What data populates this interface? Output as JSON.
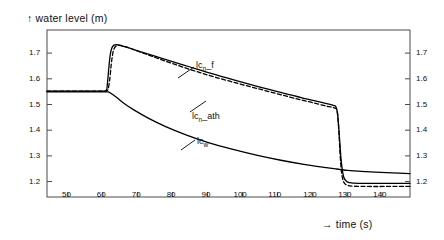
{
  "chart_data": {
    "type": "line",
    "title": "↑  water level (m)",
    "xlabel": "→  time (s)",
    "ylabel": "water level (m)",
    "xlim": [
      44,
      148
    ],
    "ylim": [
      1.14,
      1.79
    ],
    "xticks": [
      50,
      60,
      70,
      80,
      90,
      100,
      110,
      120,
      130,
      140
    ],
    "xticklabels": [
      "50",
      "60",
      "70",
      "80",
      "90",
      "100",
      "110",
      "120",
      "130",
      "140"
    ],
    "yticks": [
      1.2,
      1.3,
      1.4,
      1.5,
      1.6,
      1.7
    ],
    "yticklabels_left": [
      "1.2",
      "1.3",
      "1.4",
      "1.5",
      "1.6",
      "1.7"
    ],
    "yticklabels_right": [
      "1.2",
      "1.3",
      "1.4",
      "1.5",
      "1.6",
      "1.7"
    ],
    "grid": false,
    "legend": "inline-annotations",
    "series": [
      {
        "name": "lcn_f",
        "label_text": "lc",
        "label_sub": "n",
        "label_tail": "_f",
        "style": "dashed",
        "color": "#000000",
        "x": [
          44,
          50,
          55,
          58,
          60,
          61,
          61.5,
          62,
          62.4,
          62.8,
          63.2,
          63.8,
          64.5,
          66,
          68,
          71,
          75,
          80,
          86,
          92,
          99,
          106,
          113,
          119,
          124,
          126.5,
          127.2,
          127.6,
          128,
          128.4,
          129,
          130,
          132,
          136,
          141,
          148
        ],
        "y": [
          1.552,
          1.552,
          1.552,
          1.552,
          1.552,
          1.553,
          1.56,
          1.6,
          1.655,
          1.695,
          1.717,
          1.728,
          1.731,
          1.727,
          1.718,
          1.703,
          1.683,
          1.659,
          1.632,
          1.607,
          1.581,
          1.556,
          1.531,
          1.511,
          1.494,
          1.486,
          1.47,
          1.4,
          1.3,
          1.235,
          1.198,
          1.186,
          1.182,
          1.181,
          1.181,
          1.181
        ]
      },
      {
        "name": "lcn_ath",
        "label_text": "lc",
        "label_sub": "n",
        "label_tail": "_ath",
        "style": "solid",
        "color": "#000000",
        "x": [
          44,
          50,
          55,
          58,
          60,
          61,
          61.3,
          61.7,
          62.1,
          62.6,
          63.2,
          64,
          65,
          67,
          70,
          74,
          79,
          85,
          91,
          98,
          105,
          112,
          118,
          123,
          126,
          126.8,
          127.3,
          127.8,
          128.3,
          129,
          130,
          132,
          136,
          141,
          148
        ],
        "y": [
          1.552,
          1.552,
          1.552,
          1.552,
          1.552,
          1.555,
          1.58,
          1.64,
          1.692,
          1.721,
          1.731,
          1.733,
          1.73,
          1.722,
          1.709,
          1.692,
          1.671,
          1.646,
          1.621,
          1.594,
          1.568,
          1.543,
          1.523,
          1.507,
          1.497,
          1.49,
          1.455,
          1.37,
          1.28,
          1.218,
          1.199,
          1.194,
          1.193,
          1.193,
          1.193
        ]
      },
      {
        "name": "lcw",
        "label_text": "lc",
        "label_sub": "w",
        "label_tail": "",
        "style": "solid",
        "color": "#000000",
        "x": [
          44,
          50,
          55,
          58,
          60,
          61.5,
          62.5,
          64,
          66,
          69,
          73,
          78,
          84,
          90,
          97,
          104,
          111,
          118,
          124,
          127,
          128,
          129,
          131,
          134,
          138,
          143,
          148
        ],
        "y": [
          1.549,
          1.549,
          1.549,
          1.549,
          1.549,
          1.549,
          1.542,
          1.527,
          1.505,
          1.478,
          1.447,
          1.414,
          1.381,
          1.353,
          1.326,
          1.303,
          1.283,
          1.266,
          1.254,
          1.249,
          1.247,
          1.245,
          1.243,
          1.24,
          1.237,
          1.234,
          1.231
        ]
      }
    ],
    "annotations": [
      {
        "name": "lcn_f-label",
        "text_main": "lc",
        "sub": "n",
        "tail": "_f"
      },
      {
        "name": "lcn_ath-label",
        "text_main": "lc",
        "sub": "n",
        "tail": "_ath"
      },
      {
        "name": "lcw-label",
        "text_main": "lc",
        "sub": "w",
        "tail": ""
      }
    ]
  },
  "axes": {
    "y_title": "↑  water level (m)",
    "x_title": "→  time (s)",
    "y_arrow": "↑",
    "x_arrow": "→",
    "y_title_text": "water level (m)",
    "x_title_text": "time (s)"
  },
  "ticks": {
    "x": [
      "50",
      "60",
      "70",
      "80",
      "90",
      "100",
      "110",
      "120",
      "130",
      "140"
    ],
    "y_left": [
      "1.7",
      "1.6",
      "1.5",
      "1.4",
      "1.3",
      "1.2"
    ],
    "y_right": [
      "1.7",
      "1.6",
      "1.5",
      "1.4",
      "1.3",
      "1.2"
    ]
  },
  "labels": {
    "curve1": "lc",
    "curve1_sub": "n",
    "curve1_tail": "_f",
    "curve2": "lc",
    "curve2_sub": "n",
    "curve2_tail": "_ath",
    "curve3": "lc",
    "curve3_sub": "w",
    "curve3_tail": ""
  },
  "style": {
    "frame_color": "#4a4a4a",
    "curve_color": "#000000",
    "background": "#ffffff"
  }
}
